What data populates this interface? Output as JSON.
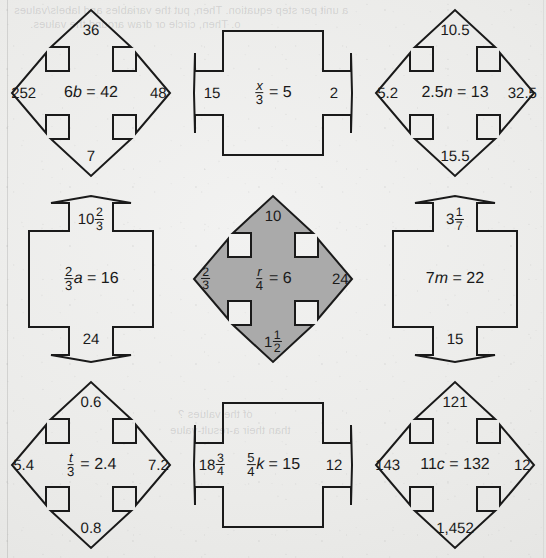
{
  "page": {
    "type": "scanned-math-worksheet",
    "background_color": "#ebebe9",
    "ink_color": "#1a1a1a",
    "highlight_fill_color": "#aaaaaa",
    "bleed_through_lines": [
      "a unit per step equation. Then, put the variables and labels/values",
      "o. Then, circle or draw around the values.",
      "of the values ?",
      "than their a-result-value"
    ]
  },
  "figures": [
    {
      "id": "figure-6b-42",
      "shape": "four-way-arrow",
      "highlighted": false,
      "equation": {
        "coefficient": "6",
        "variable": "b",
        "relation": "=",
        "result": "42",
        "display": "6b = 42"
      },
      "arrows": {
        "top": "36",
        "left": "252",
        "right": "48",
        "bottom": "7"
      }
    },
    {
      "id": "figure-x-over-3-5",
      "shape": "horizontal-arrow",
      "highlighted": false,
      "equation": {
        "numerator": "x",
        "denominator": "3",
        "relation": "=",
        "result": "5",
        "display": "x/3 = 5"
      },
      "arrows": {
        "top": null,
        "left": "15",
        "right": "2",
        "bottom": null
      }
    },
    {
      "id": "figure-2p5n-13",
      "shape": "four-way-arrow",
      "highlighted": false,
      "equation": {
        "coefficient": "2.5",
        "variable": "n",
        "relation": "=",
        "result": "13",
        "display": "2.5n = 13"
      },
      "arrows": {
        "top": "10.5",
        "left": "5.2",
        "right": "32.5",
        "bottom": "15.5"
      }
    },
    {
      "id": "figure-two-thirds-a-16",
      "shape": "vertical-arrow",
      "highlighted": false,
      "equation": {
        "coefficient_numerator": "2",
        "coefficient_denominator": "3",
        "variable": "a",
        "relation": "=",
        "result": "16",
        "display": "2/3 a = 16"
      },
      "arrows": {
        "top": "10 2/3",
        "left": null,
        "right": null,
        "bottom": "24"
      },
      "arrow_parts": {
        "top": {
          "whole": "10",
          "numerator": "2",
          "denominator": "3"
        }
      }
    },
    {
      "id": "figure-r-over-4-6",
      "shape": "four-way-arrow",
      "highlighted": true,
      "equation": {
        "numerator": "r",
        "denominator": "4",
        "relation": "=",
        "result": "6",
        "display": "r/4 = 6"
      },
      "arrows": {
        "top": "10",
        "left": "2/3",
        "right": "24",
        "bottom": "1 1/2"
      },
      "arrow_parts": {
        "left": {
          "numerator": "2",
          "denominator": "3"
        },
        "bottom": {
          "whole": "1",
          "numerator": "1",
          "denominator": "2"
        }
      }
    },
    {
      "id": "figure-7m-22",
      "shape": "vertical-arrow",
      "highlighted": false,
      "equation": {
        "coefficient": "7",
        "variable": "m",
        "relation": "=",
        "result": "22",
        "display": "7m = 22"
      },
      "arrows": {
        "top": "3 1/7",
        "left": null,
        "right": null,
        "bottom": "15"
      },
      "arrow_parts": {
        "top": {
          "whole": "3",
          "numerator": "1",
          "denominator": "7"
        }
      }
    },
    {
      "id": "figure-t-over-3-2p4",
      "shape": "four-way-arrow",
      "highlighted": false,
      "equation": {
        "numerator": "t",
        "denominator": "3",
        "relation": "=",
        "result": "2.4",
        "display": "t/3 = 2.4"
      },
      "arrows": {
        "top": "0.6",
        "left": "5.4",
        "right": "7.2",
        "bottom": "0.8"
      }
    },
    {
      "id": "figure-five-fourths-k-15",
      "shape": "horizontal-arrow",
      "highlighted": false,
      "equation": {
        "coefficient_numerator": "5",
        "coefficient_denominator": "4",
        "variable": "k",
        "relation": "=",
        "result": "15",
        "display": "5/4 k = 15"
      },
      "arrows": {
        "top": null,
        "left": "18 3/4",
        "right": "12",
        "bottom": null
      },
      "arrow_parts": {
        "left": {
          "whole": "18",
          "numerator": "3",
          "denominator": "4"
        }
      }
    },
    {
      "id": "figure-11c-132",
      "shape": "four-way-arrow",
      "highlighted": false,
      "equation": {
        "coefficient": "11",
        "variable": "c",
        "relation": "=",
        "result": "132",
        "display": "11c = 132"
      },
      "arrows": {
        "top": "121",
        "left": "143",
        "right": "12",
        "bottom": "1,452"
      }
    }
  ]
}
